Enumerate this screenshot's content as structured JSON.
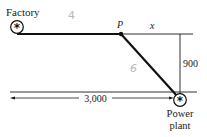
{
  "diagram": {
    "type": "geometry-word-problem",
    "nodes": {
      "factory": {
        "label": "Factory",
        "symbol": "asterisk-circle"
      },
      "point_p": {
        "label": "P"
      },
      "power_plant": {
        "label_line1": "Power",
        "label_line2": "plant",
        "symbol": "asterisk-circle"
      }
    },
    "dimensions": {
      "x_label": "x",
      "vertical_label": "900",
      "horizontal_label": "3,000"
    },
    "annotations": {
      "handwritten_top": "4",
      "handwritten_diagonal": "6"
    },
    "colors": {
      "line": "#1a1a1a",
      "route": "#111111",
      "handwriting": "#b8b8b8",
      "background": "#ffffff"
    }
  }
}
